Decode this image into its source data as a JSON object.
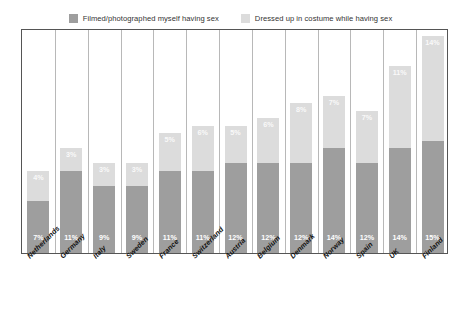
{
  "legend": {
    "items": [
      {
        "label": "Filmed/photographed myself having sex",
        "color": "#9e9e9e",
        "key": "filmed"
      },
      {
        "label": "Dressed up in costume while having sex",
        "color": "#dcdcdc",
        "key": "costume"
      }
    ]
  },
  "chart_data": {
    "type": "bar",
    "subtype": "stacked-column",
    "title": "",
    "subtitle": "",
    "xlabel": "",
    "ylabel": "",
    "ylim": [
      0,
      30
    ],
    "grid": "vertical-separators-only",
    "legend_position": "top-center",
    "axis_ticks_visible": false,
    "value_labels_suffix": "%",
    "categories": [
      "Netherlands",
      "Germany",
      "Italy",
      "Sweden",
      "France",
      "Switzerland",
      "Austria",
      "Belgium",
      "Denmark",
      "Norway",
      "Spain",
      "UK",
      "Finland"
    ],
    "series": [
      {
        "name": "Filmed/photographed myself having sex",
        "color": "#9e9e9e",
        "values": [
          7,
          11,
          9,
          9,
          11,
          11,
          12,
          12,
          12,
          14,
          12,
          14,
          15
        ],
        "labels": [
          "7%",
          "11%",
          "9%",
          "9%",
          "11%",
          "11%",
          "12%",
          "12%",
          "12%",
          "14%",
          "12%",
          "14%",
          "15%"
        ]
      },
      {
        "name": "Dressed up in costume while having sex",
        "color": "#dcdcdc",
        "values": [
          4,
          3,
          3,
          3,
          5,
          6,
          5,
          6,
          8,
          7,
          7,
          11,
          14
        ],
        "labels": [
          "4%",
          "3%",
          "3%",
          "3%",
          "5%",
          "6%",
          "5%",
          "6%",
          "8%",
          "7%",
          "7%",
          "11%",
          "14%"
        ]
      }
    ],
    "totals": [
      11,
      14,
      12,
      12,
      16,
      17,
      17,
      18,
      20,
      21,
      19,
      25,
      29
    ]
  },
  "colors": {
    "series_dark": "#9e9e9e",
    "series_light": "#dcdcdc",
    "frame": "#555555",
    "gridline": "#b8b8b8",
    "background": "#ffffff",
    "label_text": "#111111",
    "value_text": "#ffffff"
  }
}
